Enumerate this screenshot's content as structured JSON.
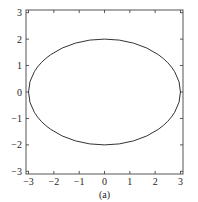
{
  "chart_data": {
    "type": "line",
    "title": "",
    "caption": "(a)",
    "xlabel": "",
    "ylabel": "",
    "xlim": [
      -3.1,
      3.1
    ],
    "ylim": [
      -3.1,
      3.1
    ],
    "xticks": [
      -3,
      -2,
      -1,
      0,
      1,
      2,
      3
    ],
    "yticks": [
      -3,
      -2,
      -1,
      0,
      1,
      2,
      3
    ],
    "grid": false,
    "legend": null,
    "series": [
      {
        "name": "ellipse",
        "shape": "ellipse",
        "center": [
          0,
          0
        ],
        "semi_axis_x": 3,
        "semi_axis_y": 2,
        "equation": "x^2/9 + y^2/4 = 1",
        "color": "#333333"
      }
    ]
  },
  "colors": {
    "axis": "#555555",
    "curve": "#333333",
    "background": "#ffffff"
  }
}
